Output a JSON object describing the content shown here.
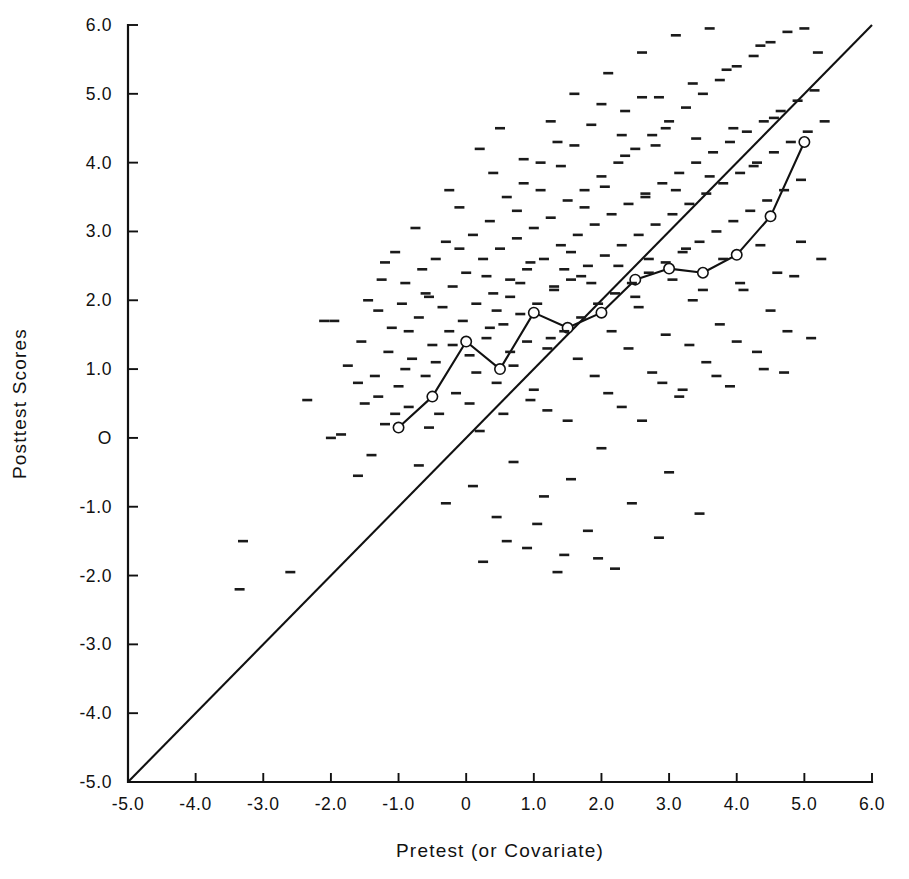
{
  "chart_data": {
    "type": "scatter",
    "title": "",
    "xlabel": "Pretest (or Covariate)",
    "ylabel": "Posttest Scores",
    "xlim": [
      -5.0,
      6.0
    ],
    "ylim": [
      -5.0,
      6.0
    ],
    "grid": false,
    "legend": "none",
    "xticks": [
      -5.0,
      -4.0,
      -3.0,
      -2.0,
      -1.0,
      0,
      1.0,
      2.0,
      3.0,
      4.0,
      5.0,
      6.0
    ],
    "xticklabels": [
      "-5.0",
      "-4.0",
      "-3.0",
      "-2.0",
      "-1.0",
      "0",
      "1.0",
      "2.0",
      "3.0",
      "4.0",
      "5.0",
      "6.0"
    ],
    "yticks": [
      -5.0,
      -4.0,
      -3.0,
      -2.0,
      -1.0,
      0,
      1.0,
      2.0,
      3.0,
      4.0,
      5.0,
      6.0
    ],
    "yticklabels": [
      "-5.0",
      "-4.0",
      "-3.0",
      "-2.0",
      "-1.0",
      "O",
      "1.0",
      "2.0",
      "3.0",
      "4.0",
      "5.0",
      "6.0"
    ],
    "series": [
      {
        "name": "identity-reference-line",
        "type": "line",
        "marker": "none",
        "description": "45 degree reference line y = x",
        "points": [
          [
            -5.0,
            -5.0
          ],
          [
            6.0,
            6.0
          ]
        ]
      },
      {
        "name": "conditional-means",
        "type": "line",
        "marker": "open-circle",
        "description": "Mean posttest score within pretest intervals",
        "points": [
          [
            -1.0,
            0.15
          ],
          [
            -0.5,
            0.6
          ],
          [
            0.0,
            1.4
          ],
          [
            0.5,
            1.0
          ],
          [
            1.0,
            1.82
          ],
          [
            1.5,
            1.6
          ],
          [
            2.0,
            1.82
          ],
          [
            2.5,
            2.3
          ],
          [
            3.0,
            2.46
          ],
          [
            3.5,
            2.4
          ],
          [
            4.0,
            2.66
          ],
          [
            4.5,
            3.22
          ],
          [
            5.0,
            4.3
          ]
        ]
      },
      {
        "name": "observations",
        "type": "scatter",
        "marker": "horizontal-dash",
        "points": [
          [
            -3.35,
            -2.2
          ],
          [
            -3.3,
            -1.5
          ],
          [
            -2.6,
            -1.95
          ],
          [
            -2.35,
            0.55
          ],
          [
            -2.1,
            1.7
          ],
          [
            -1.95,
            1.7
          ],
          [
            -1.75,
            1.05
          ],
          [
            -1.6,
            -0.55
          ],
          [
            -1.55,
            1.4
          ],
          [
            -1.5,
            0.5
          ],
          [
            -1.45,
            2.0
          ],
          [
            -1.35,
            0.9
          ],
          [
            -1.3,
            1.85
          ],
          [
            -1.25,
            2.3
          ],
          [
            -1.2,
            0.2
          ],
          [
            -1.15,
            1.25
          ],
          [
            -1.1,
            1.6
          ],
          [
            -1.05,
            2.7
          ],
          [
            -1.0,
            0.75
          ],
          [
            -0.95,
            1.95
          ],
          [
            -0.9,
            2.25
          ],
          [
            -0.85,
            0.45
          ],
          [
            -0.8,
            1.15
          ],
          [
            -0.75,
            3.05
          ],
          [
            -0.7,
            1.75
          ],
          [
            -0.65,
            2.45
          ],
          [
            -0.6,
            0.9
          ],
          [
            -0.55,
            2.05
          ],
          [
            -0.5,
            1.35
          ],
          [
            -0.45,
            2.6
          ],
          [
            -0.4,
            0.35
          ],
          [
            -0.35,
            1.9
          ],
          [
            -0.3,
            2.85
          ],
          [
            -0.25,
            1.55
          ],
          [
            -0.2,
            2.2
          ],
          [
            -0.15,
            0.65
          ],
          [
            -0.1,
            3.35
          ],
          [
            -0.05,
            1.7
          ],
          [
            0.0,
            2.4
          ],
          [
            0.05,
            1.2
          ],
          [
            0.1,
            2.95
          ],
          [
            0.15,
            1.95
          ],
          [
            0.2,
            0.1
          ],
          [
            0.25,
            2.6
          ],
          [
            0.3,
            1.45
          ],
          [
            0.35,
            3.15
          ],
          [
            0.4,
            2.1
          ],
          [
            0.45,
            0.8
          ],
          [
            0.5,
            2.75
          ],
          [
            0.55,
            1.65
          ],
          [
            0.6,
            3.5
          ],
          [
            0.65,
            2.3
          ],
          [
            0.7,
            1.05
          ],
          [
            0.75,
            2.9
          ],
          [
            0.8,
            1.8
          ],
          [
            0.85,
            3.7
          ],
          [
            0.9,
            2.45
          ],
          [
            0.95,
            0.55
          ],
          [
            1.0,
            3.05
          ],
          [
            1.05,
            1.95
          ],
          [
            1.1,
            4.0
          ],
          [
            1.15,
            2.6
          ],
          [
            1.2,
            1.3
          ],
          [
            1.25,
            3.2
          ],
          [
            1.3,
            2.15
          ],
          [
            1.35,
            4.3
          ],
          [
            1.4,
            2.8
          ],
          [
            1.45,
            1.55
          ],
          [
            1.5,
            3.45
          ],
          [
            1.55,
            2.3
          ],
          [
            1.6,
            5.0
          ],
          [
            1.65,
            2.95
          ],
          [
            1.7,
            1.75
          ],
          [
            1.75,
            3.6
          ],
          [
            1.8,
            2.5
          ],
          [
            1.85,
            4.55
          ],
          [
            1.9,
            3.1
          ],
          [
            1.95,
            1.95
          ],
          [
            2.0,
            3.8
          ],
          [
            2.05,
            2.65
          ],
          [
            2.1,
            5.3
          ],
          [
            2.15,
            3.25
          ],
          [
            2.2,
            2.1
          ],
          [
            2.25,
            4.0
          ],
          [
            2.3,
            2.8
          ],
          [
            2.35,
            4.75
          ],
          [
            2.4,
            3.4
          ],
          [
            2.45,
            2.25
          ],
          [
            2.5,
            4.2
          ],
          [
            2.55,
            2.95
          ],
          [
            2.6,
            5.6
          ],
          [
            2.65,
            3.55
          ],
          [
            2.7,
            2.4
          ],
          [
            2.75,
            4.4
          ],
          [
            2.8,
            3.1
          ],
          [
            2.85,
            4.95
          ],
          [
            2.9,
            3.7
          ],
          [
            2.95,
            2.55
          ],
          [
            3.0,
            4.6
          ],
          [
            3.05,
            3.25
          ],
          [
            3.1,
            5.85
          ],
          [
            3.15,
            3.85
          ],
          [
            3.2,
            2.7
          ],
          [
            3.25,
            4.8
          ],
          [
            3.3,
            3.4
          ],
          [
            3.35,
            5.15
          ],
          [
            3.4,
            4.0
          ],
          [
            3.45,
            2.85
          ],
          [
            3.5,
            5.0
          ],
          [
            3.55,
            3.55
          ],
          [
            3.6,
            5.95
          ],
          [
            3.65,
            4.15
          ],
          [
            3.7,
            3.0
          ],
          [
            3.75,
            5.2
          ],
          [
            3.8,
            3.7
          ],
          [
            3.85,
            5.35
          ],
          [
            3.9,
            4.3
          ],
          [
            3.95,
            3.15
          ],
          [
            4.0,
            5.4
          ],
          [
            4.05,
            3.85
          ],
          [
            4.15,
            4.45
          ],
          [
            4.2,
            3.3
          ],
          [
            4.25,
            5.55
          ],
          [
            4.3,
            4.0
          ],
          [
            4.35,
            5.7
          ],
          [
            4.4,
            4.6
          ],
          [
            4.45,
            3.45
          ],
          [
            4.5,
            5.75
          ],
          [
            4.55,
            4.15
          ],
          [
            4.65,
            4.75
          ],
          [
            4.7,
            3.6
          ],
          [
            4.75,
            5.9
          ],
          [
            4.8,
            4.3
          ],
          [
            4.9,
            4.9
          ],
          [
            4.95,
            3.75
          ],
          [
            5.0,
            5.95
          ],
          [
            5.05,
            4.45
          ],
          [
            5.15,
            5.05
          ],
          [
            5.2,
            5.6
          ],
          [
            5.3,
            4.6
          ],
          [
            -1.85,
            0.05
          ],
          [
            -1.4,
            -0.25
          ],
          [
            -0.7,
            -0.4
          ],
          [
            -0.3,
            -0.95
          ],
          [
            0.1,
            -0.7
          ],
          [
            0.45,
            -1.15
          ],
          [
            0.7,
            -0.35
          ],
          [
            0.9,
            -1.6
          ],
          [
            1.15,
            -0.85
          ],
          [
            1.35,
            -1.95
          ],
          [
            1.55,
            -0.6
          ],
          [
            1.8,
            -1.35
          ],
          [
            2.0,
            -0.15
          ],
          [
            2.2,
            -1.9
          ],
          [
            2.45,
            -0.95
          ],
          [
            2.6,
            0.25
          ],
          [
            2.85,
            -1.45
          ],
          [
            3.0,
            -0.5
          ],
          [
            3.2,
            0.7
          ],
          [
            3.45,
            -1.1
          ],
          [
            0.25,
            -1.8
          ],
          [
            0.6,
            -1.5
          ],
          [
            1.05,
            -1.25
          ],
          [
            1.45,
            -1.7
          ],
          [
            1.95,
            -1.75
          ],
          [
            -2.0,
            0.0
          ],
          [
            -1.6,
            0.8
          ],
          [
            -1.2,
            2.55
          ],
          [
            -0.9,
            1.0
          ],
          [
            -0.55,
            0.15
          ],
          [
            0.15,
            0.95
          ],
          [
            0.35,
            1.6
          ],
          [
            0.55,
            0.35
          ],
          [
            0.8,
            2.25
          ],
          [
            1.0,
            0.7
          ],
          [
            1.25,
            1.45
          ],
          [
            1.5,
            0.25
          ],
          [
            1.7,
            2.35
          ],
          [
            1.9,
            0.9
          ],
          [
            2.15,
            1.55
          ],
          [
            2.3,
            0.45
          ],
          [
            2.55,
            1.9
          ],
          [
            2.75,
            0.95
          ],
          [
            2.95,
            1.5
          ],
          [
            3.15,
            0.6
          ],
          [
            3.35,
            2.0
          ],
          [
            3.55,
            1.1
          ],
          [
            3.75,
            1.65
          ],
          [
            3.9,
            0.75
          ],
          [
            4.1,
            2.15
          ],
          [
            4.3,
            1.25
          ],
          [
            4.5,
            1.85
          ],
          [
            4.7,
            0.95
          ],
          [
            4.85,
            2.35
          ],
          [
            5.1,
            1.45
          ],
          [
            -1.05,
            0.35
          ],
          [
            -0.45,
            1.1
          ],
          [
            0.05,
            0.5
          ],
          [
            0.65,
            1.25
          ],
          [
            1.2,
            0.4
          ],
          [
            1.65,
            1.15
          ],
          [
            2.1,
            0.65
          ],
          [
            2.4,
            1.3
          ],
          [
            2.9,
            0.8
          ],
          [
            3.3,
            1.35
          ],
          [
            3.7,
            0.9
          ],
          [
            4.0,
            1.4
          ],
          [
            4.4,
            1.0
          ],
          [
            4.75,
            1.55
          ],
          [
            5.25,
            2.6
          ],
          [
            0.95,
            2.55
          ],
          [
            1.3,
            2.2
          ],
          [
            1.55,
            2.7
          ],
          [
            1.85,
            2.25
          ],
          [
            2.25,
            2.5
          ],
          [
            2.5,
            2.05
          ],
          [
            2.7,
            2.6
          ],
          [
            3.05,
            2.3
          ],
          [
            3.25,
            2.75
          ],
          [
            3.5,
            2.15
          ],
          [
            3.8,
            2.6
          ],
          [
            4.05,
            2.25
          ],
          [
            4.35,
            2.8
          ],
          [
            4.6,
            2.4
          ],
          [
            4.95,
            2.85
          ],
          [
            0.4,
            3.85
          ],
          [
            0.75,
            3.3
          ],
          [
            1.1,
            3.6
          ],
          [
            1.4,
            3.95
          ],
          [
            1.75,
            3.35
          ],
          [
            2.05,
            3.65
          ],
          [
            2.35,
            4.1
          ],
          [
            2.65,
            3.5
          ],
          [
            2.8,
            4.25
          ],
          [
            3.1,
            3.6
          ],
          [
            3.4,
            4.35
          ],
          [
            3.6,
            3.8
          ],
          [
            3.95,
            4.5
          ],
          [
            4.25,
            3.95
          ],
          [
            4.55,
            4.65
          ],
          [
            -0.25,
            3.6
          ],
          [
            0.2,
            4.2
          ],
          [
            0.5,
            4.5
          ],
          [
            0.85,
            4.05
          ],
          [
            1.25,
            4.6
          ],
          [
            1.6,
            4.25
          ],
          [
            2.0,
            4.85
          ],
          [
            2.3,
            4.4
          ],
          [
            2.6,
            4.95
          ],
          [
            2.95,
            4.5
          ],
          [
            -0.6,
            2.1
          ],
          [
            -0.1,
            2.75
          ],
          [
            0.3,
            2.35
          ],
          [
            0.65,
            2.05
          ],
          [
            1.45,
            2.45
          ],
          [
            -1.3,
            0.6
          ],
          [
            -0.85,
            1.55
          ],
          [
            -0.2,
            1.35
          ],
          [
            0.45,
            1.85
          ],
          [
            0.9,
            1.4
          ]
        ]
      }
    ]
  }
}
